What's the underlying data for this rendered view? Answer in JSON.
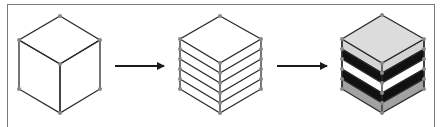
{
  "diagram": {
    "stages": [
      {
        "id": "solid-cube",
        "layers": 0
      },
      {
        "id": "sliced-cube",
        "layers": 5
      },
      {
        "id": "layered-material-cube",
        "layers": 5,
        "layer_colors": [
          "#d4d4d4",
          "#111111",
          "#ffffff",
          "#111111",
          "#a2a2a2"
        ],
        "top_color": "#dcdcdc"
      }
    ],
    "arrows": [
      {
        "from": "solid-cube",
        "to": "sliced-cube"
      },
      {
        "from": "sliced-cube",
        "to": "layered-material-cube"
      }
    ],
    "colors": {
      "edge": "#2b2b2b",
      "vertex": "#8a8a8a",
      "frame": "#7a7a7a",
      "arrow": "#1a1a1a"
    }
  }
}
